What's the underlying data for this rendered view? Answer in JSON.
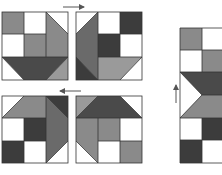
{
  "diagram": {
    "colors": {
      "white": "#ffffff",
      "light": "#9a9a9a",
      "medium": "#7c7c7c",
      "dark": "#3c3c3c",
      "outline": "#4a4a4a",
      "arrow": "#555555"
    },
    "blocks": [
      {
        "id": "block-top-left",
        "x": 2,
        "y": 12,
        "size": 66
      },
      {
        "id": "block-top-right",
        "x": 76,
        "y": 12,
        "size": 66
      },
      {
        "id": "block-bottom-left",
        "x": 2,
        "y": 96,
        "size": 66
      },
      {
        "id": "block-bottom-right",
        "x": 76,
        "y": 96,
        "size": 66
      },
      {
        "id": "block-side-strip",
        "x": 180,
        "y": 28,
        "width": 44,
        "height": 135
      }
    ],
    "arrows": [
      {
        "id": "arrow-right",
        "direction": "right",
        "x1": 63,
        "y1": 7,
        "x2": 84,
        "y2": 7
      },
      {
        "id": "arrow-left",
        "direction": "left",
        "x1": 81,
        "y1": 91,
        "x2": 60,
        "y2": 91
      },
      {
        "id": "arrow-up",
        "direction": "up",
        "x1": 176,
        "y1": 103,
        "x2": 176,
        "y2": 85
      }
    ]
  }
}
